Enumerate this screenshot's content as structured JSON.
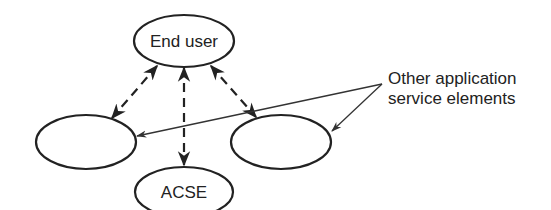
{
  "diagram": {
    "nodes": [
      {
        "id": "end-user",
        "label": "End user"
      },
      {
        "id": "left-ase",
        "label": ""
      },
      {
        "id": "right-ase",
        "label": ""
      },
      {
        "id": "acse",
        "label": "ACSE"
      }
    ],
    "edges": [
      {
        "from": "end-user",
        "to": "left-ase",
        "style": "dashed",
        "arrows": "both"
      },
      {
        "from": "end-user",
        "to": "acse",
        "style": "dashed",
        "arrows": "both"
      },
      {
        "from": "end-user",
        "to": "right-ase",
        "style": "dashed",
        "arrows": "both"
      }
    ],
    "callout": {
      "lines": [
        "Other application",
        "service elements"
      ],
      "targets": [
        "left-ase",
        "right-ase"
      ]
    }
  }
}
